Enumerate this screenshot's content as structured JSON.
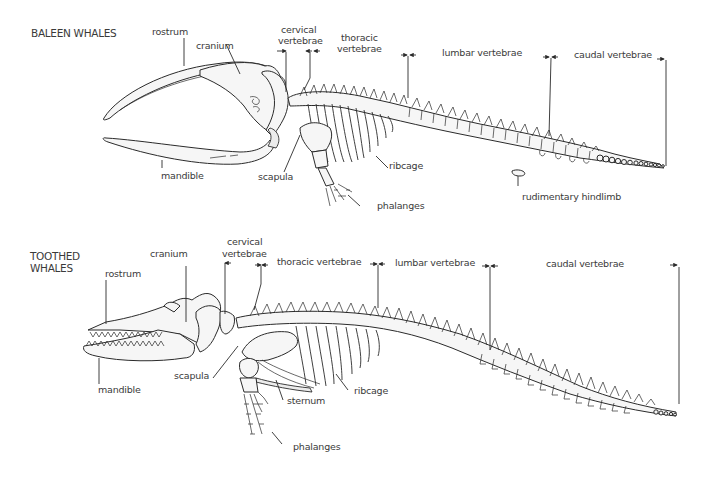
{
  "baleen": {
    "title": "BALEEN WHALES",
    "labels": {
      "rostrum": "rostrum",
      "cranium": "cranium",
      "cervical_1": "cervical",
      "cervical_2": "vertebrae",
      "thoracic_1": "thoracic",
      "thoracic_2": "vertebrae",
      "lumbar": "lumbar vertebrae",
      "caudal": "caudal vertebrae",
      "mandible": "mandible",
      "scapula": "scapula",
      "ribcage": "ribcage",
      "phalanges": "phalanges",
      "hindlimb": "rudimentary hindlimb"
    }
  },
  "toothed": {
    "title_1": "TOOTHED",
    "title_2": "WHALES",
    "labels": {
      "rostrum": "rostrum",
      "cranium": "cranium",
      "cervical_1": "cervical",
      "cervical_2": "vertebrae",
      "thoracic": "thoracic vertebrae",
      "lumbar": "lumbar vertebrae",
      "caudal": "caudal vertebrae",
      "mandible": "mandible",
      "scapula": "scapula",
      "sternum": "sternum",
      "ribcage": "ribcage",
      "phalanges": "phalanges"
    }
  },
  "colors": {
    "line": "#2b2b2b",
    "bone_fill": "#f6f6f6",
    "text": "#3a3a3a",
    "background": "#ffffff"
  }
}
